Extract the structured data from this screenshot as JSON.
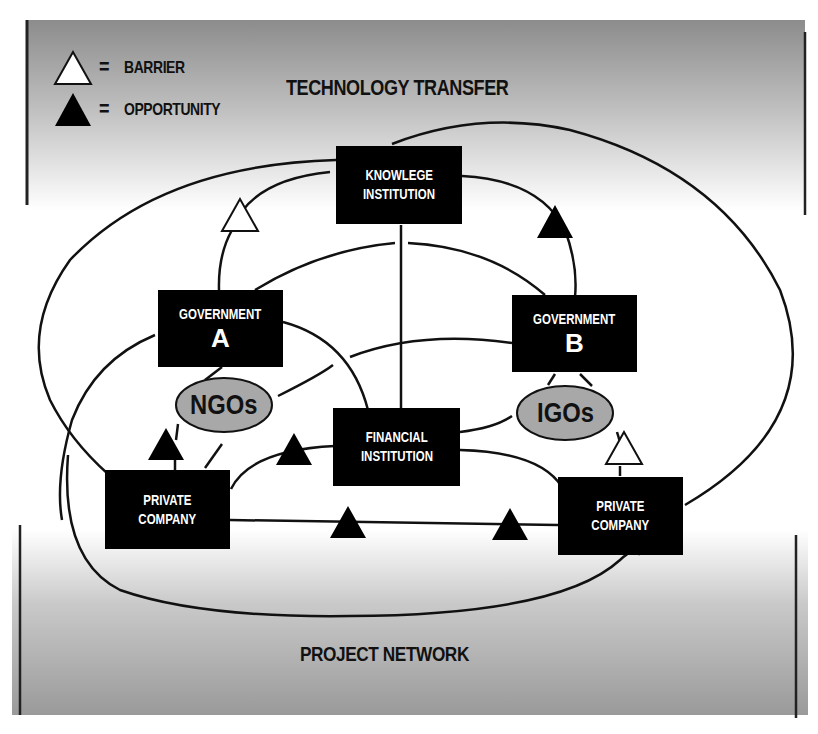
{
  "title": "TECHNOLOGY TRANSFER",
  "footer_label": "PROJECT NETWORK",
  "legend": {
    "barrier": {
      "symbol": "white-triangle",
      "equals": "=",
      "label": "BARRIER"
    },
    "opportunity": {
      "symbol": "black-triangle",
      "equals": "=",
      "label": "OPPORTUNITY"
    }
  },
  "nodes": {
    "knowledge_institution": {
      "line1": "KNOWLEGE",
      "line2": "INSTITUTION"
    },
    "government_a": {
      "line1": "GOVERNMENT",
      "line2": "A"
    },
    "government_b": {
      "line1": "GOVERNMENT",
      "line2": "B"
    },
    "financial_institution": {
      "line1": "FINANCIAL",
      "line2": "INSTITUTION"
    },
    "private_company_left": {
      "line1": "PRIVATE",
      "line2": "COMPANY"
    },
    "private_company_right": {
      "line1": "PRIVATE",
      "line2": "COMPANY"
    }
  },
  "groups": {
    "ngos": "NGOs",
    "igos": "IGOs"
  },
  "markers": [
    {
      "type": "barrier",
      "between": [
        "Government A",
        "Knowledge Institution"
      ]
    },
    {
      "type": "opportunity",
      "between": [
        "Knowledge Institution",
        "Government B"
      ]
    },
    {
      "type": "opportunity",
      "between": [
        "Private Company (left)",
        "NGOs"
      ]
    },
    {
      "type": "opportunity",
      "between": [
        "Private Company (left)",
        "Financial Institution"
      ]
    },
    {
      "type": "opportunity",
      "between": [
        "Private Company (left)",
        "Private Company (right)"
      ]
    },
    {
      "type": "opportunity",
      "between": [
        "Private Company (left)",
        "Private Company (right)"
      ]
    },
    {
      "type": "barrier",
      "between": [
        "Private Company (right)",
        "IGOs"
      ]
    }
  ],
  "colors": {
    "node_fill": "#000000",
    "node_text": "#ffffff",
    "ellipse_fill": "#a8a8a8",
    "gradient_dark": "#8c8c8c",
    "line": "#111111"
  }
}
